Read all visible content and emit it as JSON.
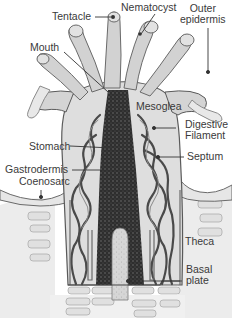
{
  "diagram": {
    "labels": {
      "tentacle": "Tentacle",
      "nematocyst": "Nematocyst",
      "outer_epidermis": "Outer\nepidermis",
      "mouth": "Mouth",
      "mesoglea": "Mesoglea",
      "digestive_filament": "Digestive\nFilament",
      "stomach": "Stomach",
      "septum": "Septum",
      "gastrodermis": "Gastrodermis",
      "coenosarc": "Coenosarc",
      "theca": "Theca",
      "basal_plate": "Basal\nplate"
    },
    "colors": {
      "background": "#ffffff",
      "tissue_light": "#d9d9d9",
      "tissue_mid": "#a8a8a8",
      "tissue_dark": "#3c3c3c",
      "outline": "#4a4a4a",
      "label_text": "#3a3a3a",
      "leader_line": "#333333"
    }
  }
}
